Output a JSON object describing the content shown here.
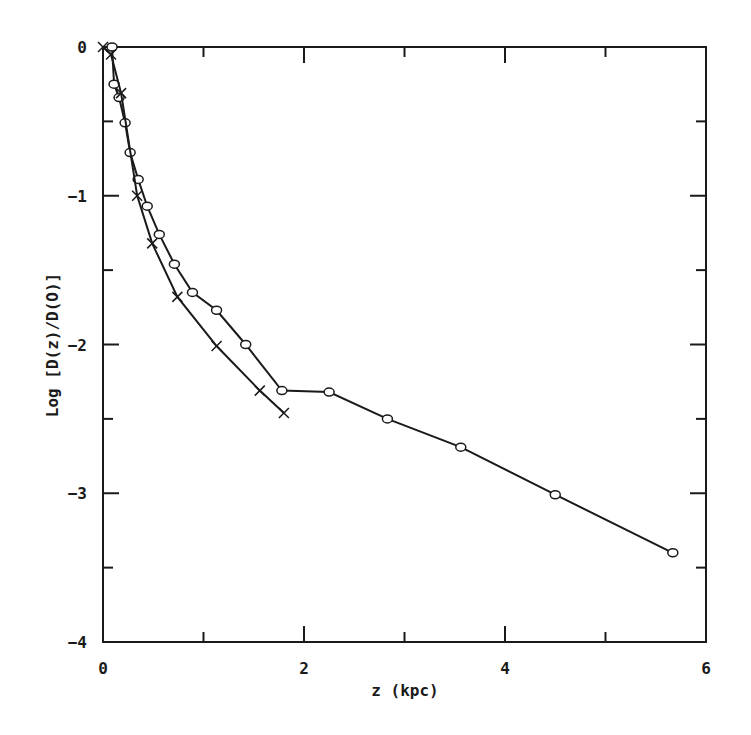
{
  "chart_data": {
    "type": "line",
    "title": "",
    "xlabel": "z (kpc)",
    "ylabel": "Log [D(z)/D(O)]",
    "xlim": [
      0,
      6
    ],
    "ylim": [
      -4,
      0
    ],
    "x_ticks": [
      0,
      2,
      4,
      6
    ],
    "x_tick_labels": [
      "0",
      "2",
      "4",
      "6"
    ],
    "x_minor_ticks": [
      1,
      3,
      5
    ],
    "y_ticks": [
      0,
      -1,
      -2,
      -3,
      -4
    ],
    "y_tick_labels": [
      "0",
      "−1",
      "−2",
      "−3",
      "−4"
    ],
    "y_minor_ticks": [
      -0.5,
      -1.5,
      -2.5,
      -3.5
    ],
    "grid": false,
    "legend": null,
    "series": [
      {
        "name": "circles",
        "marker": "circle",
        "x": [
          0.09,
          0.11,
          0.16,
          0.22,
          0.27,
          0.35,
          0.44,
          0.56,
          0.71,
          0.89,
          1.13,
          1.42,
          1.78,
          2.25,
          2.83,
          3.56,
          4.5,
          5.67
        ],
        "y": [
          0.0,
          -0.25,
          -0.34,
          -0.51,
          -0.71,
          -0.89,
          -1.07,
          -1.26,
          -1.46,
          -1.65,
          -1.77,
          -2.0,
          -2.31,
          -2.32,
          -2.5,
          -2.69,
          -3.01,
          -3.4
        ]
      },
      {
        "name": "crosses",
        "marker": "x",
        "x": [
          0.0,
          0.08,
          0.18,
          0.34,
          0.49,
          0.74,
          1.13,
          1.56,
          1.8
        ],
        "y": [
          0.0,
          -0.05,
          -0.31,
          -1.0,
          -1.32,
          -1.68,
          -2.01,
          -2.31,
          -2.46
        ]
      }
    ]
  },
  "colors": {
    "ink": "#1a1a1a",
    "background": "#ffffff"
  }
}
